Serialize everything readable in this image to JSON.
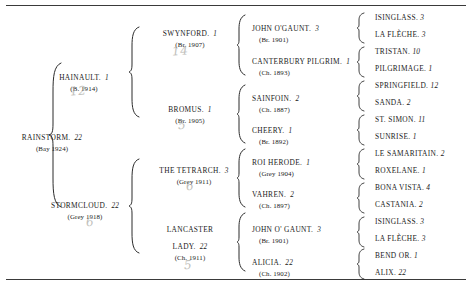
{
  "document": {
    "type": "thoroughbred-pedigree-chart",
    "rules": {
      "top": "horizontal-rule",
      "bottom": "horizontal-rule"
    }
  },
  "subject": {
    "name": "RAINSTORM.",
    "fignum": "22",
    "detail": "(Bay 1924)"
  },
  "generation2": [
    {
      "name": "HAINAULT.",
      "fignum": "1",
      "detail": "(B. 1914)",
      "pencil": "12"
    },
    {
      "name": "STORMCLOUD.",
      "fignum": "22",
      "detail": "(Grey 1918)",
      "pencil": "6"
    }
  ],
  "generation3": [
    {
      "name": "SWYNFORD.",
      "fignum": "1",
      "detail": "(Br. 1907)",
      "pencil": "14"
    },
    {
      "name": "BROMUS.",
      "fignum": "1",
      "detail": "(Br. 1905)",
      "pencil": "5"
    },
    {
      "name": "THE TETRARCH.",
      "fignum": "3",
      "detail": "(Grey 1911)",
      "pencil": "6"
    },
    {
      "name": "LANCASTER",
      "name2": "LADY.",
      "fignum": "22",
      "detail": "(Ch. 1911)",
      "pencil": "5"
    }
  ],
  "generation4": [
    {
      "name": "JOHN O'GAUNT.",
      "fignum": "3",
      "detail": "(Br. 1901)"
    },
    {
      "name": "CANTERBURY PILGRIM.",
      "fignum": "1",
      "detail": "(Ch. 1893)"
    },
    {
      "name": "SAINFOIN.",
      "fignum": "2",
      "detail": "(Ch. 1887)"
    },
    {
      "name": "CHEERY.",
      "fignum": "1",
      "detail": "(Br. 1892)"
    },
    {
      "name": "ROI HERODE.",
      "fignum": "1",
      "detail": "(Grey 1904)"
    },
    {
      "name": "VAHREN.",
      "fignum": "2",
      "detail": "(Ch. 1897)"
    },
    {
      "name": "JOHN O' GAUNT.",
      "fignum": "3",
      "detail": "(Br. 1901)"
    },
    {
      "name": "ALICIA.",
      "fignum": "22",
      "detail": "(Ch. 1902)"
    }
  ],
  "generation5": [
    {
      "name": "ISINGLASS.",
      "fignum": "3"
    },
    {
      "name": "LA FLÈCHE.",
      "fignum": "3"
    },
    {
      "name": "TRISTAN.",
      "fignum": "10"
    },
    {
      "name": "PILGRIMAGE.",
      "fignum": "1"
    },
    {
      "name": "SPRINGFIELD.",
      "fignum": "12"
    },
    {
      "name": "SANDA.",
      "fignum": "2"
    },
    {
      "name": "ST. SIMON.",
      "fignum": "11"
    },
    {
      "name": "SUNRISE.",
      "fignum": "1"
    },
    {
      "name": "LE SAMARITAIN.",
      "fignum": "2"
    },
    {
      "name": "ROXELANE.",
      "fignum": "1"
    },
    {
      "name": "BONA VISTA.",
      "fignum": "4"
    },
    {
      "name": "CASTANIA.",
      "fignum": "2"
    },
    {
      "name": "ISINGLASS.",
      "fignum": "3"
    },
    {
      "name": "LA FLÈCHE.",
      "fignum": "3"
    },
    {
      "name": "BEND OR.",
      "fignum": "1"
    },
    {
      "name": "ALIX.",
      "fignum": "22"
    }
  ]
}
